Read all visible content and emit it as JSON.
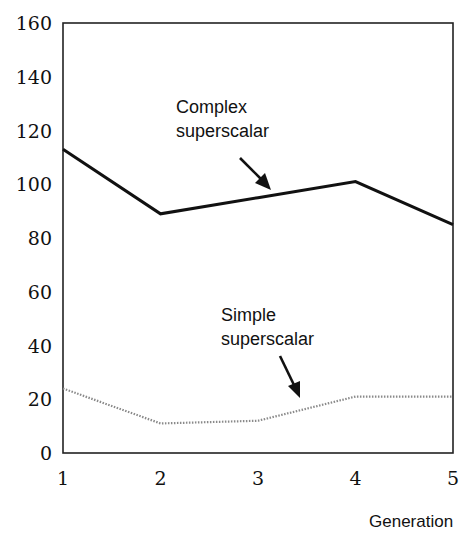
{
  "chart_data": {
    "type": "line",
    "title": "",
    "xlabel": "Generation",
    "ylabel": "",
    "x": [
      1,
      2,
      3,
      4,
      5
    ],
    "xticks": [
      "1",
      "2",
      "3",
      "4",
      "5"
    ],
    "yticks": [
      "0",
      "20",
      "40",
      "60",
      "80",
      "100",
      "120",
      "140",
      "160"
    ],
    "ylim": [
      0,
      160
    ],
    "xlim": [
      1,
      5
    ],
    "grid": false,
    "legend": "none (inline annotations with arrows)",
    "series": [
      {
        "name": "Complex superscalar",
        "style": "solid",
        "color": "#111111",
        "values": [
          113,
          89,
          95,
          101,
          85
        ]
      },
      {
        "name": "Simple superscalar",
        "style": "dotted",
        "color": "#888888",
        "values": [
          24,
          11,
          12,
          21,
          21
        ]
      }
    ],
    "annotations": [
      {
        "text": [
          "Complex",
          "superscalar"
        ],
        "points_to": "Complex superscalar",
        "near_x": 3
      },
      {
        "text": [
          "Simple",
          "superscalar"
        ],
        "points_to": "Simple superscalar",
        "near_x": 3.5
      }
    ]
  },
  "labels": {
    "complex_line1": "Complex",
    "complex_line2": "superscalar",
    "simple_line1": "Simple",
    "simple_line2": "superscalar",
    "xlabel": "Generation"
  }
}
